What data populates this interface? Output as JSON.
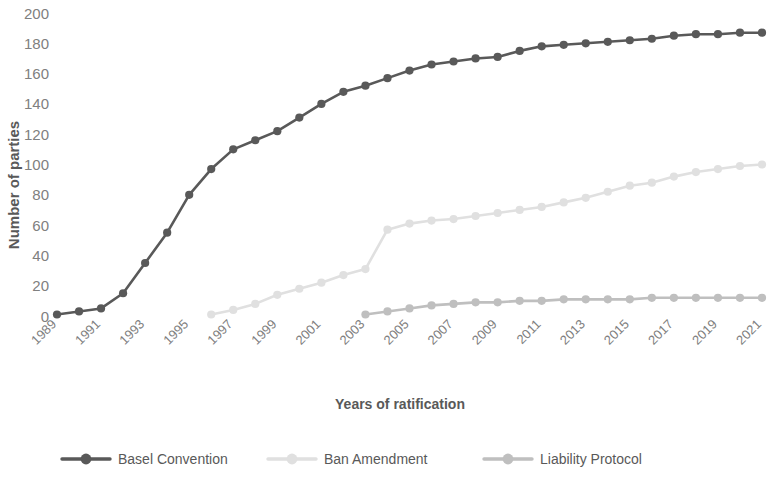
{
  "chart_data": {
    "type": "line",
    "title": "",
    "xlabel": "Years of ratification",
    "ylabel": "Number of parties",
    "ylim": [
      0,
      200
    ],
    "ytick_step": 20,
    "yticks": [
      "0",
      "20",
      "40",
      "60",
      "80",
      "100",
      "120",
      "140",
      "160",
      "180",
      "200"
    ],
    "xlim": [
      1989,
      2021
    ],
    "x": [
      1989,
      1990,
      1991,
      1992,
      1993,
      1994,
      1995,
      1996,
      1997,
      1998,
      1999,
      2000,
      2001,
      2002,
      2003,
      2004,
      2005,
      2006,
      2007,
      2008,
      2009,
      2010,
      2011,
      2012,
      2013,
      2014,
      2015,
      2016,
      2017,
      2018,
      2019,
      2020,
      2021
    ],
    "xticks": [
      "1989",
      "1991",
      "1993",
      "1995",
      "1997",
      "1999",
      "2001",
      "2003",
      "2005",
      "2007",
      "2009",
      "2011",
      "2013",
      "2015",
      "2017",
      "2019",
      "2021"
    ],
    "grid": false,
    "legend_position": "bottom",
    "series": [
      {
        "name": "Basel Convention",
        "color": "#595959",
        "values": [
          1,
          3,
          5,
          15,
          35,
          55,
          80,
          97,
          110,
          116,
          122,
          131,
          140,
          148,
          152,
          157,
          162,
          166,
          168,
          170,
          171,
          175,
          178,
          179,
          180,
          181,
          182,
          183,
          185,
          186,
          186,
          187,
          187
        ]
      },
      {
        "name": "Ban Amendment",
        "color": "#e0e0e0",
        "values": [
          null,
          null,
          null,
          null,
          null,
          null,
          null,
          1,
          4,
          8,
          14,
          18,
          22,
          27,
          31,
          57,
          61,
          63,
          64,
          66,
          68,
          70,
          72,
          75,
          78,
          82,
          86,
          88,
          92,
          95,
          97,
          99,
          100
        ]
      },
      {
        "name": "Liability Protocol",
        "color": "#bfbfbf",
        "values": [
          null,
          null,
          null,
          null,
          null,
          null,
          null,
          null,
          null,
          null,
          null,
          null,
          null,
          null,
          1,
          3,
          5,
          7,
          8,
          9,
          9,
          10,
          10,
          11,
          11,
          11,
          11,
          12,
          12,
          12,
          12,
          12,
          12
        ]
      }
    ]
  },
  "legend": {
    "items": [
      {
        "label": "Basel Convention"
      },
      {
        "label": "Ban Amendment"
      },
      {
        "label": "Liability Protocol"
      }
    ]
  }
}
